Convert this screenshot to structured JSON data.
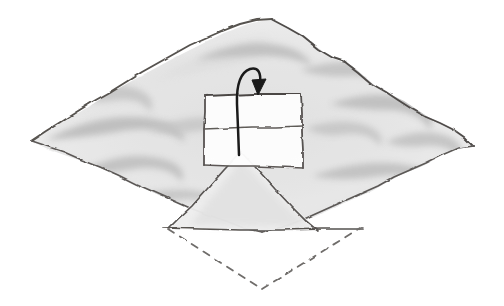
{
  "figure": {
    "medium": "pencil-sketch",
    "background_color": "#ffffff",
    "text_labels": [],
    "colors": {
      "outline": "#555250",
      "outline_light": "#8a8886",
      "shading_light": "#e9e9e9",
      "shading_mid": "#d2d2d2",
      "shading_dark": "#b4b4b4",
      "arrow": "#1a1a1a",
      "box_fill": "#fdfdfd",
      "dashed_line": "#6f6d6b",
      "paper": "#ffffff"
    },
    "elements": {
      "terrain": {
        "name": "undulating diamond terrain surface",
        "shape": "rhombus",
        "vertices": [
          {
            "label": "top",
            "x": 271,
            "y": 19
          },
          {
            "label": "right",
            "x": 473,
            "y": 146
          },
          {
            "label": "bottom",
            "x": 262,
            "y": 232
          },
          {
            "label": "left",
            "x": 31,
            "y": 141
          }
        ],
        "stroke_style": "rough sketched contour",
        "fill_description": "soft graphite wash with wavy dune-like ridges"
      },
      "waves": {
        "name": "swirling dune ridges",
        "count": 11,
        "description": "elongated comma and hook shaped graphite smudges suggesting rippled ground"
      },
      "peak": {
        "name": "central triangular peak",
        "apex": {
          "x": 241,
          "y": 152
        },
        "base_left": {
          "x": 168,
          "y": 229
        },
        "base_right": {
          "x": 318,
          "y": 231
        },
        "description": "tent-like triangle rising from the terrain centre"
      },
      "box": {
        "name": "overlaid rectangular panel",
        "corners": [
          {
            "label": "top-left",
            "x": 205,
            "y": 96
          },
          {
            "label": "top-right",
            "x": 301,
            "y": 94
          },
          {
            "label": "bottom-right",
            "x": 303,
            "y": 168
          },
          {
            "label": "bottom-left",
            "x": 204,
            "y": 165
          }
        ],
        "divider_line": {
          "x1": 204,
          "y1": 129,
          "x2": 302,
          "y2": 126
        },
        "fill": "#fdfdfd",
        "description": "slightly tilted quadrilateral split into two panes by a horizontal line"
      },
      "arrow": {
        "name": "curved hook arrow",
        "direction": "up-over-and-down",
        "tail": {
          "x": 239,
          "y": 155
        },
        "loop_top": {
          "x": 250,
          "y": 68
        },
        "head": {
          "x": 258,
          "y": 92
        },
        "head_shape": "solid triangular arrowhead pointing down",
        "color": "#1a1a1a",
        "stroke_width": 2.4
      },
      "dashed_edges": {
        "name": "projected hidden base edges",
        "style": "dashed",
        "dash_pattern": "7 7",
        "segments": [
          {
            "from": {
              "x": 168,
              "y": 229
            },
            "to": {
              "x": 262,
              "y": 289
            }
          },
          {
            "from": {
              "x": 262,
              "y": 289
            },
            "to": {
              "x": 360,
              "y": 228
            }
          }
        ]
      },
      "solid_base_line": {
        "name": "solid horizontal base line",
        "from": {
          "x": 163,
          "y": 228
        },
        "to": {
          "x": 363,
          "y": 229
        }
      }
    }
  }
}
